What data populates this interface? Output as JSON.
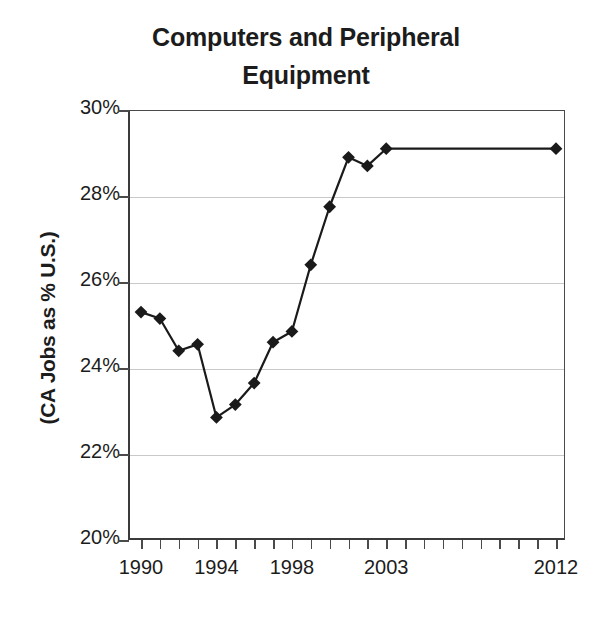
{
  "chart_data": {
    "type": "line",
    "title": "Computers and Peripheral\nEquipment",
    "title_line1": "Computers and Peripheral",
    "title_line2": "Equipment",
    "xlabel": "",
    "ylabel": "(CA Jobs as % U.S.)",
    "ylim": [
      20,
      30
    ],
    "y_tick_labels": [
      "30%",
      "28%",
      "26%",
      "24%",
      "22%",
      "20%"
    ],
    "y_ticks": [
      30,
      28,
      26,
      24,
      22,
      20
    ],
    "y_tick_format": "percent",
    "grid": "horizontal",
    "legend": "none",
    "marker": "diamond",
    "marker_color": "#1a1a1a",
    "line_color": "#1a1a1a",
    "x": [
      1990,
      1991,
      1992,
      1993,
      1994,
      1995,
      1996,
      1997,
      1998,
      1999,
      2000,
      2001,
      2002,
      2003,
      2012
    ],
    "x_axis_categories": [
      1990,
      1991,
      1992,
      1993,
      1994,
      1995,
      1996,
      1997,
      1998,
      1999,
      2000,
      2001,
      2002,
      2003,
      2004,
      2005,
      2006,
      2007,
      2008,
      2009,
      2010,
      2011,
      2012
    ],
    "x_tick_labels_shown": [
      "1990",
      "1994",
      "1998",
      "2003",
      "2012"
    ],
    "x_tick_label_positions": [
      1990,
      1994,
      1998,
      2003,
      2012
    ],
    "values": [
      25.3,
      25.15,
      24.4,
      24.55,
      22.85,
      23.15,
      23.65,
      24.6,
      24.85,
      26.4,
      27.75,
      28.9,
      28.7,
      29.1,
      29.1
    ],
    "series": [
      {
        "name": "CA Jobs as % U.S.",
        "points": [
          {
            "x": 1990,
            "y": 25.3
          },
          {
            "x": 1991,
            "y": 25.15
          },
          {
            "x": 1992,
            "y": 24.4
          },
          {
            "x": 1993,
            "y": 24.55
          },
          {
            "x": 1994,
            "y": 22.85
          },
          {
            "x": 1995,
            "y": 23.15
          },
          {
            "x": 1996,
            "y": 23.65
          },
          {
            "x": 1997,
            "y": 24.6
          },
          {
            "x": 1998,
            "y": 24.85
          },
          {
            "x": 1999,
            "y": 26.4
          },
          {
            "x": 2000,
            "y": 27.75
          },
          {
            "x": 2001,
            "y": 28.9
          },
          {
            "x": 2002,
            "y": 28.7
          },
          {
            "x": 2003,
            "y": 29.1
          },
          {
            "x": 2012,
            "y": 29.1
          }
        ]
      }
    ]
  }
}
